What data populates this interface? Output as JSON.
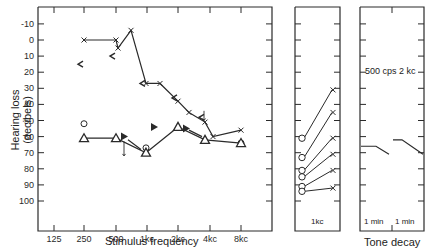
{
  "chart_data": [
    {
      "type": "scatter",
      "title": "",
      "xlabel": "Stimulus frequency",
      "ylabel": "Hearing loss (decibels)",
      "x_ticks": [
        "125",
        "250",
        "500",
        "1kc",
        "2kc",
        "4kc",
        "8kc"
      ],
      "y_ticks": [
        -10,
        0,
        10,
        20,
        30,
        40,
        50,
        60,
        70,
        80,
        90,
        100
      ],
      "ylim": [
        -20,
        108
      ],
      "y_inverted": true,
      "grid": false,
      "series": [
        {
          "name": "Air conduction (x)",
          "marker": "x",
          "connected": true,
          "points": [
            [
              "250",
              0
            ],
            [
              "500",
              0
            ],
            [
              "1kc-",
              5
            ],
            [
              "1kc-mid",
              -6
            ],
            [
              "1kc",
              27
            ],
            [
              "2kc-",
              27
            ],
            [
              "2kc",
              38
            ],
            [
              "2kc+",
              45
            ],
            [
              "4kc",
              51
            ],
            [
              "4kc+",
              60
            ],
            [
              "8kc",
              56
            ]
          ]
        },
        {
          "name": "Bone conduction (<)",
          "marker": "<",
          "connected": false,
          "points": [
            [
              "250",
              15
            ],
            [
              "500",
              10
            ],
            [
              "1kc",
              27
            ],
            [
              "2kc",
              36
            ],
            [
              "4kc",
              48
            ]
          ]
        },
        {
          "name": "Air conduction other ear (o)",
          "marker": "o",
          "connected": false,
          "points": [
            [
              "250",
              52
            ],
            [
              "1kc",
              67
            ],
            [
              "8kc",
              64
            ]
          ]
        },
        {
          "name": "Masked (triangle)",
          "marker": "triangle",
          "connected": true,
          "points": [
            [
              "250",
              61
            ],
            [
              "500",
              61
            ],
            [
              "1kc",
              70
            ],
            [
              "2kc",
              54
            ],
            [
              "4kc",
              62
            ],
            [
              "8kc",
              64
            ]
          ]
        },
        {
          "name": "Masked bone (filled triangle)",
          "marker": "filled-triangle",
          "connected": false,
          "points": [
            [
              "500",
              60
            ],
            [
              "1kc",
              54
            ],
            [
              "2kc",
              55
            ]
          ]
        }
      ]
    },
    {
      "type": "line",
      "title": "",
      "xlabel": "1kc",
      "ylabel": "",
      "pairs_o_to_x": [
        [
          61,
          31
        ],
        [
          73,
          45
        ],
        [
          81,
          61
        ],
        [
          85,
          71
        ],
        [
          91,
          81
        ],
        [
          94,
          92
        ]
      ]
    },
    {
      "type": "line",
      "title": "",
      "xlabel": "Tone decay",
      "annotation": "500 cps   2 kc",
      "x_ticks": [
        "1 min",
        "1 min"
      ],
      "series": [
        {
          "name": "500 cps",
          "values": [
            66,
            66,
            71
          ]
        },
        {
          "name": "2 kc",
          "values": [
            62,
            62,
            71
          ]
        }
      ]
    }
  ],
  "labels": {
    "y_axis": "Hearing loss (decibels)",
    "x_axis": "Stimulus frequency",
    "panel2_x": "1kc",
    "panel3_x": "Tone decay",
    "panel3_t1": "1 min",
    "panel3_t2": "1 min",
    "panel3_note": "500 cps   2 kc"
  }
}
